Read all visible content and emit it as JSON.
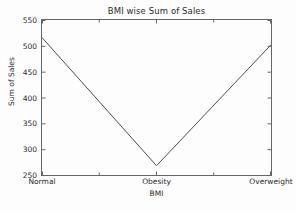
{
  "chart_data": {
    "type": "line",
    "title": "BMI wise Sum of Sales",
    "xlabel": "BMI",
    "ylabel": "Sum of Sales",
    "categories": [
      "Normal",
      "Obesity",
      "Overweight"
    ],
    "values": [
      516,
      268,
      502
    ],
    "series": [
      {
        "name": "Sum of Sales",
        "values": [
          516,
          268,
          502
        ]
      }
    ],
    "ylim": [
      250,
      550
    ],
    "yticks": [
      250,
      300,
      350,
      400,
      450,
      500,
      550
    ],
    "ytick_labels": [
      "250",
      "300",
      "350",
      "400",
      "450",
      "500",
      "550"
    ],
    "xticks": [
      0,
      1,
      2
    ],
    "xtick_labels": [
      "Normal",
      "Obesity",
      "Overweight"
    ],
    "grid": false,
    "legend": null,
    "line_color": "#4d4d4d",
    "line_width": 1,
    "frame_color": "#666666",
    "background_color": "#ffffff",
    "text_color": "#2b2b2b"
  }
}
